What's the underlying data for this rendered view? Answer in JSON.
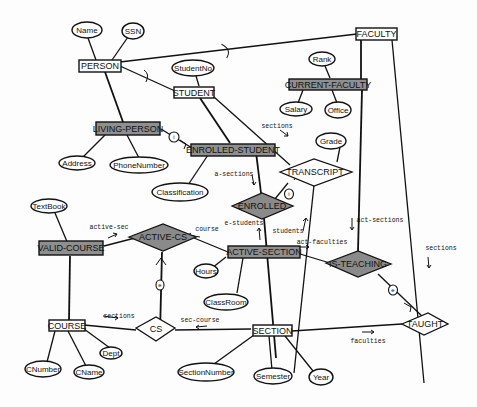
{
  "diagram": {
    "type": "entity-relationship",
    "entities": [
      {
        "id": "person",
        "label": "PERSON",
        "shaded": false
      },
      {
        "id": "student",
        "label": "STUDENT",
        "shaded": false
      },
      {
        "id": "faculty",
        "label": "FACULTY",
        "shaded": false
      },
      {
        "id": "current_faculty",
        "label": "CURRENT-FACULTY",
        "shaded": true
      },
      {
        "id": "living_person",
        "label": "LIVING-PERSON",
        "shaded": true
      },
      {
        "id": "enrolled_student",
        "label": "ENROLLED-STUDENT",
        "shaded": true
      },
      {
        "id": "valid_course",
        "label": "VALID-COURSE",
        "shaded": true
      },
      {
        "id": "active_section",
        "label": "ACTIVE-SECTION",
        "shaded": true
      },
      {
        "id": "course",
        "label": "COURSE",
        "shaded": false
      },
      {
        "id": "section",
        "label": "SECTION",
        "shaded": false
      }
    ],
    "relationships": [
      {
        "id": "transcript",
        "label": "TRANSCRIPT",
        "shaded": false
      },
      {
        "id": "enrolled",
        "label": "ENROLLED",
        "shaded": true
      },
      {
        "id": "active_cs",
        "label": "ACTIVE-CS",
        "shaded": true
      },
      {
        "id": "is_teaching",
        "label": "IS-TEACHING",
        "shaded": true
      },
      {
        "id": "cs",
        "label": "CS",
        "shaded": false
      },
      {
        "id": "taught",
        "label": "TAUGHT",
        "shaded": false
      }
    ],
    "attributes": [
      {
        "id": "name",
        "label": "Name"
      },
      {
        "id": "ssn",
        "label": "SSN"
      },
      {
        "id": "studentno",
        "label": "StudentNo"
      },
      {
        "id": "rank",
        "label": "Rank"
      },
      {
        "id": "salary",
        "label": "Salary"
      },
      {
        "id": "office",
        "label": "Office"
      },
      {
        "id": "address",
        "label": "Address"
      },
      {
        "id": "phonenumber",
        "label": "PhoneNumber"
      },
      {
        "id": "classification",
        "label": "Classification"
      },
      {
        "id": "grade",
        "label": "Grade"
      },
      {
        "id": "textbook",
        "label": "TextBook"
      },
      {
        "id": "hours",
        "label": "Hours"
      },
      {
        "id": "classroom",
        "label": "ClassRoom"
      },
      {
        "id": "cnumber",
        "label": "CNumber"
      },
      {
        "id": "cname",
        "label": "CName"
      },
      {
        "id": "dept",
        "label": "Dept"
      },
      {
        "id": "sectionnumber",
        "label": "SectionNumber"
      },
      {
        "id": "semester",
        "label": "Semester"
      },
      {
        "id": "year",
        "label": "Year"
      }
    ],
    "role_labels": {
      "sections_top": "sections",
      "a_sections": "a-sections",
      "e_students": "e-students",
      "students": "students",
      "active_sec": "active-sec",
      "course": "course",
      "act_faculties": "act-faculties",
      "act_sections": "act-sections",
      "sections_right": "sections",
      "sections_bottom": "sections",
      "sec_course": "sec-course",
      "faculties": "faculties"
    },
    "markers": {
      "living_enrolled": "i",
      "transcript_enrolled": "i",
      "cs_active": "e",
      "teaching_taught": "e"
    }
  }
}
